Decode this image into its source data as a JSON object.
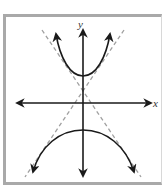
{
  "diagram": {
    "type": "hyperbola-graph",
    "axes": {
      "x_label": "x",
      "y_label": "y"
    },
    "colors": {
      "curve": "#1a1a1a",
      "axis": "#1a1a1a",
      "asymptote": "#a0a0a0",
      "frame": "#a9a9a9"
    },
    "elements": [
      "x-axis",
      "y-axis",
      "upper-branch",
      "lower-branch",
      "asymptote-1",
      "asymptote-2"
    ]
  }
}
